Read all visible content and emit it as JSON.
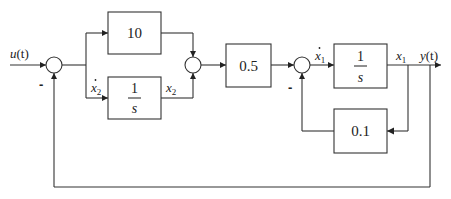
{
  "diagram": {
    "type": "control-system block diagram",
    "blocks": [
      {
        "id": "gain_10",
        "label": "10"
      },
      {
        "id": "integrator_x2",
        "numerator": "1",
        "denominator": "s"
      },
      {
        "id": "gain_05",
        "label": "0.5"
      },
      {
        "id": "integrator_x1",
        "numerator": "1",
        "denominator": "s"
      },
      {
        "id": "gain_01",
        "label": "0.1"
      }
    ],
    "signals": {
      "input": {
        "base": "u",
        "arg": "(t)"
      },
      "output": {
        "base": "y",
        "arg": "(t)"
      },
      "x2dot": {
        "base": "x",
        "sub": "2"
      },
      "x2": {
        "base": "x",
        "sub": "2"
      },
      "x1dot": {
        "base": "x",
        "sub": "1"
      },
      "x1": {
        "base": "x",
        "sub": "1"
      }
    },
    "signs": {
      "sum1_feedback": "-",
      "sum3_feedback": "-"
    },
    "summing_junctions": [
      {
        "id": "sum1",
        "inputs": [
          "u(t) +",
          "y(t) -"
        ]
      },
      {
        "id": "sum2",
        "inputs": [
          "10 branch +",
          "x2 +"
        ]
      },
      {
        "id": "sum3",
        "inputs": [
          "0.5 output +",
          "0.1·x1 -"
        ]
      }
    ]
  }
}
